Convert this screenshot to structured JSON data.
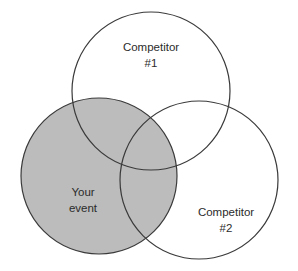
{
  "diagram": {
    "type": "venn",
    "canvas": {
      "width": 298,
      "height": 271
    },
    "background_color": "#ffffff",
    "stroke_color": "#3a3a3a",
    "stroke_width": 1.2,
    "fill_color": "#bcbcbc",
    "text_color": "#2b2b2b",
    "sets": [
      {
        "id": "competitor-1",
        "label_line1": "Competitor",
        "label_line2": "#1",
        "filled": false,
        "cx": 151,
        "cy": 91,
        "r": 79,
        "label_x": 151,
        "label_y": 48
      },
      {
        "id": "competitor-2",
        "label_line1": "Competitor",
        "label_line2": "#2",
        "filled": false,
        "cx": 199,
        "cy": 180,
        "r": 79,
        "label_x": 226,
        "label_y": 213
      },
      {
        "id": "your-event",
        "label_line1": "Your",
        "label_line2": "event",
        "filled": true,
        "cx": 99,
        "cy": 176,
        "r": 78,
        "label_x": 83,
        "label_y": 193
      }
    ]
  }
}
